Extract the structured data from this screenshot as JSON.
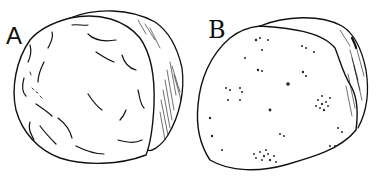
{
  "figures": [
    {
      "label": "A",
      "description": "cut tuber section with curved streak markings"
    },
    {
      "label": "B",
      "description": "cut tuber section with scattered speckle clusters"
    }
  ]
}
